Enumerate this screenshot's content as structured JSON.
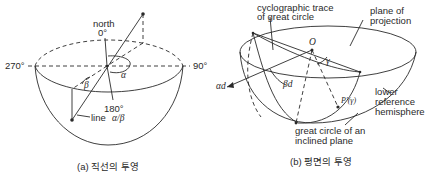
{
  "figure_a": {
    "caption": "(a) 직선의 투영",
    "labels": {
      "north": "north",
      "deg0": "0°",
      "deg90": "90°",
      "deg180": "180°",
      "deg270": "270°",
      "alpha": "α",
      "beta": "β",
      "line_prefix": "line",
      "line_symbol": "α/β"
    }
  },
  "figure_b": {
    "caption": "(b) 평면의 투영",
    "labels": {
      "cyclographic_line1": "cyclographic trace",
      "cyclographic_line2": "of great circle",
      "plane_line1": "plane of",
      "plane_line2": "projection",
      "origin": "O",
      "gamma": "γ",
      "alpha_d": "αd",
      "beta_d": "βd",
      "pole": "P′(γ)",
      "hemi_line1": "lower",
      "hemi_line2": "reference",
      "hemi_line3": "hemisphere",
      "great_line1": "great circle of an",
      "great_line2": "inclined plane"
    }
  },
  "colors": {
    "ink": "#2a2a2a",
    "background": "#ffffff"
  }
}
